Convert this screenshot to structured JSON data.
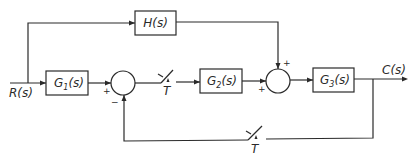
{
  "diagram": {
    "type": "block diagram",
    "input": {
      "label": "R(s)"
    },
    "output": {
      "label": "C(s)"
    },
    "blocks": {
      "G1": {
        "main": "G",
        "sub": "1",
        "tail": "(s)"
      },
      "G2": {
        "main": "G",
        "sub": "2",
        "tail": "(s)"
      },
      "G3": {
        "main": "G",
        "sub": "3",
        "tail": "(s)"
      },
      "H": {
        "label": "H(s)"
      }
    },
    "summing_junctions": {
      "sum1": {
        "plus": "+",
        "minus": "−"
      },
      "sum2": {
        "plus_left": "+",
        "plus_top": "+"
      }
    },
    "samplers": {
      "forward": {
        "label": "T"
      },
      "feedback": {
        "label": "T"
      }
    },
    "line_color": "#2a2a2a"
  }
}
